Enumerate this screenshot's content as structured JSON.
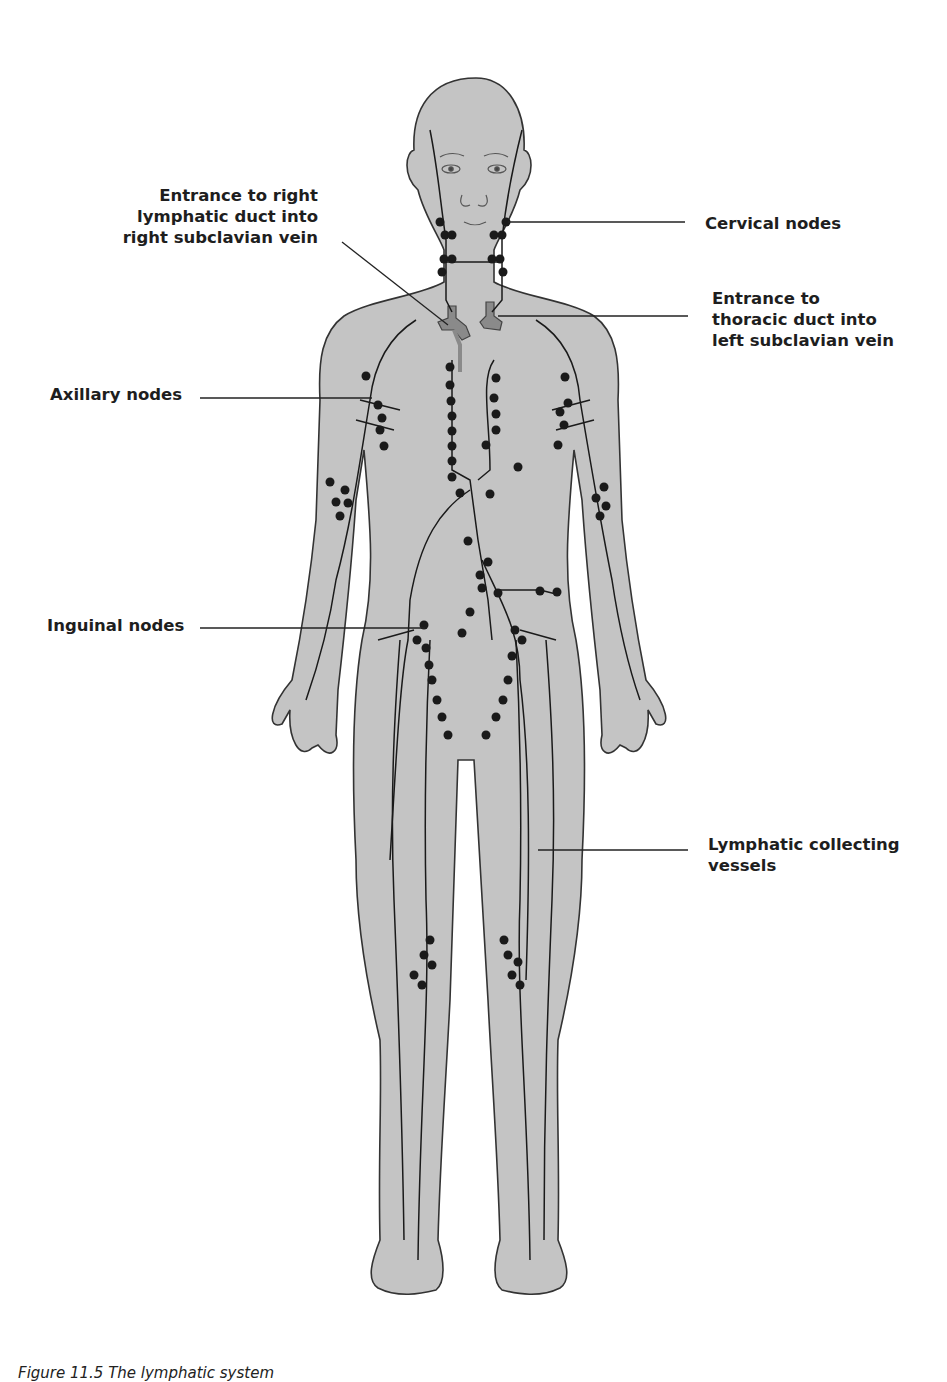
{
  "figure": {
    "caption": "Figure 11.5  The lymphatic system",
    "colors": {
      "body_fill": "#c4c4c4",
      "outline": "#333333",
      "vessel": "#1a1a1a",
      "node": "#1a1a1a",
      "duct": "#8a8a8a",
      "leader_line": "#222222"
    }
  },
  "labels": {
    "right_lymphatic_duct": {
      "line1": "Entrance to right",
      "line2": "lymphatic duct into",
      "line3": "right subclavian vein"
    },
    "cervical_nodes": {
      "line1": "Cervical nodes"
    },
    "thoracic_duct": {
      "line1": "Entrance to",
      "line2": "thoracic duct into",
      "line3": "left subclavian vein"
    },
    "axillary_nodes": {
      "line1": "Axillary nodes"
    },
    "inguinal_nodes": {
      "line1": "Inguinal nodes"
    },
    "collecting_vessels": {
      "line1": "Lymphatic collecting",
      "line2": "vessels"
    }
  }
}
